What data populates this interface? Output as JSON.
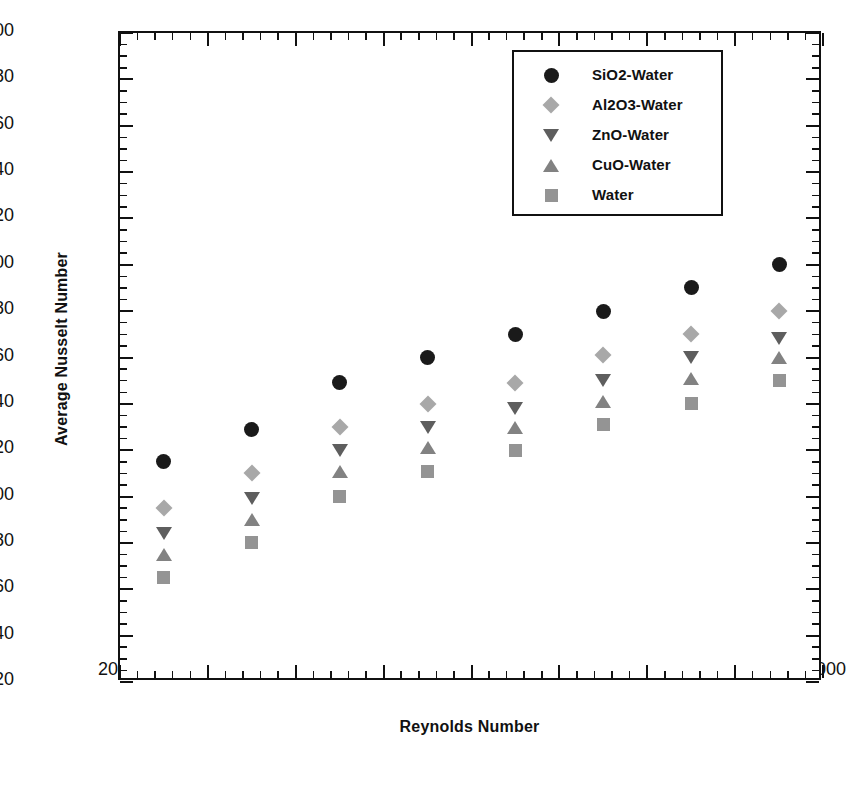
{
  "chart_data": {
    "type": "scatter",
    "title": "",
    "xlabel": "Reynolds Number",
    "ylabel": "Average Nusselt Number",
    "xlim": [
      2000,
      10000
    ],
    "ylim": [
      20,
      300
    ],
    "x_major_step": 1000,
    "x_minor_step": 200,
    "y_major_step": 20,
    "y_minor_step": 5,
    "grid": false,
    "legend_position": "upper right",
    "x_tick_labels": [
      "2000",
      "3000",
      "4000",
      "5000",
      "6000",
      "7000",
      "8000",
      "9000",
      "10000"
    ],
    "y_tick_labels": [
      "20",
      "40",
      "60",
      "80",
      "100",
      "120",
      "140",
      "160",
      "180",
      "200",
      "220",
      "240",
      "260",
      "280",
      "300"
    ],
    "x": [
      2500,
      3500,
      4500,
      5500,
      6500,
      7500,
      8500,
      9500
    ],
    "series": [
      {
        "name": "SiO2-Water",
        "marker": "circle",
        "color": "#1a1a1a",
        "values": [
          115,
          129,
          149,
          160,
          170,
          180,
          190,
          200
        ]
      },
      {
        "name": "Al2O3-Water",
        "marker": "diamond",
        "color": "#a8a8a8",
        "values": [
          95,
          110,
          130,
          140,
          149,
          161,
          170,
          180
        ]
      },
      {
        "name": "ZnO-Water",
        "marker": "triangle-down",
        "color": "#5e5e5e",
        "values": [
          84,
          99,
          120,
          130,
          138,
          150,
          160,
          168
        ]
      },
      {
        "name": "CuO-Water",
        "marker": "triangle-up",
        "color": "#828282",
        "values": [
          75,
          90,
          111,
          121,
          130,
          141,
          151,
          160
        ]
      },
      {
        "name": "Water",
        "marker": "square",
        "color": "#949494",
        "values": [
          65,
          80,
          100,
          111,
          120,
          131,
          140,
          150
        ]
      }
    ]
  },
  "legend": {
    "entries": [
      "SiO2-Water",
      "Al2O3-Water",
      "ZnO-Water",
      "CuO-Water",
      "Water"
    ]
  },
  "caption": ""
}
